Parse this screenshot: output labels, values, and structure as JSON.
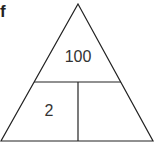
{
  "part_label": "f",
  "triangle": {
    "top": "100",
    "bottom_left": "2",
    "bottom_right": ""
  },
  "colors": {
    "line": "#222222",
    "text": "#333333"
  }
}
